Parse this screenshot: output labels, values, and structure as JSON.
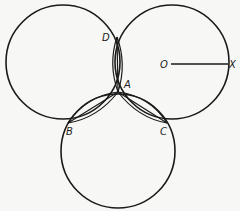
{
  "diagram": {
    "type": "geometric-construction",
    "color": "#1a1a1a",
    "background": "#f7f7f5",
    "circles": [
      {
        "name": "left-circle",
        "cx": 63,
        "cy": 62,
        "r": 57
      },
      {
        "name": "right-circle",
        "cx": 172,
        "cy": 62,
        "r": 57
      },
      {
        "name": "bottom-circle",
        "cx": 118,
        "cy": 151,
        "r": 57
      }
    ],
    "points": {
      "A": {
        "label": "A",
        "x": 118,
        "y": 92
      },
      "B": {
        "label": "B",
        "x": 68,
        "y": 123
      },
      "C": {
        "label": "C",
        "x": 167,
        "y": 123
      },
      "D": {
        "label": "D",
        "x": 117,
        "y": 37
      },
      "O": {
        "label": "O",
        "x": 172,
        "y": 64
      },
      "X": {
        "label": "X",
        "x": 228,
        "y": 64
      }
    },
    "labels": {
      "A": "A",
      "B": "B",
      "C": "C",
      "D": "D",
      "O": "O",
      "X": "X"
    },
    "segments": [
      {
        "name": "radius-OX",
        "from": "O",
        "to": "X"
      },
      {
        "name": "chord-AD",
        "from": "A",
        "to": "D"
      },
      {
        "name": "chord-AB",
        "from": "A",
        "to": "B"
      },
      {
        "name": "chord-AC",
        "from": "A",
        "to": "C"
      }
    ]
  }
}
